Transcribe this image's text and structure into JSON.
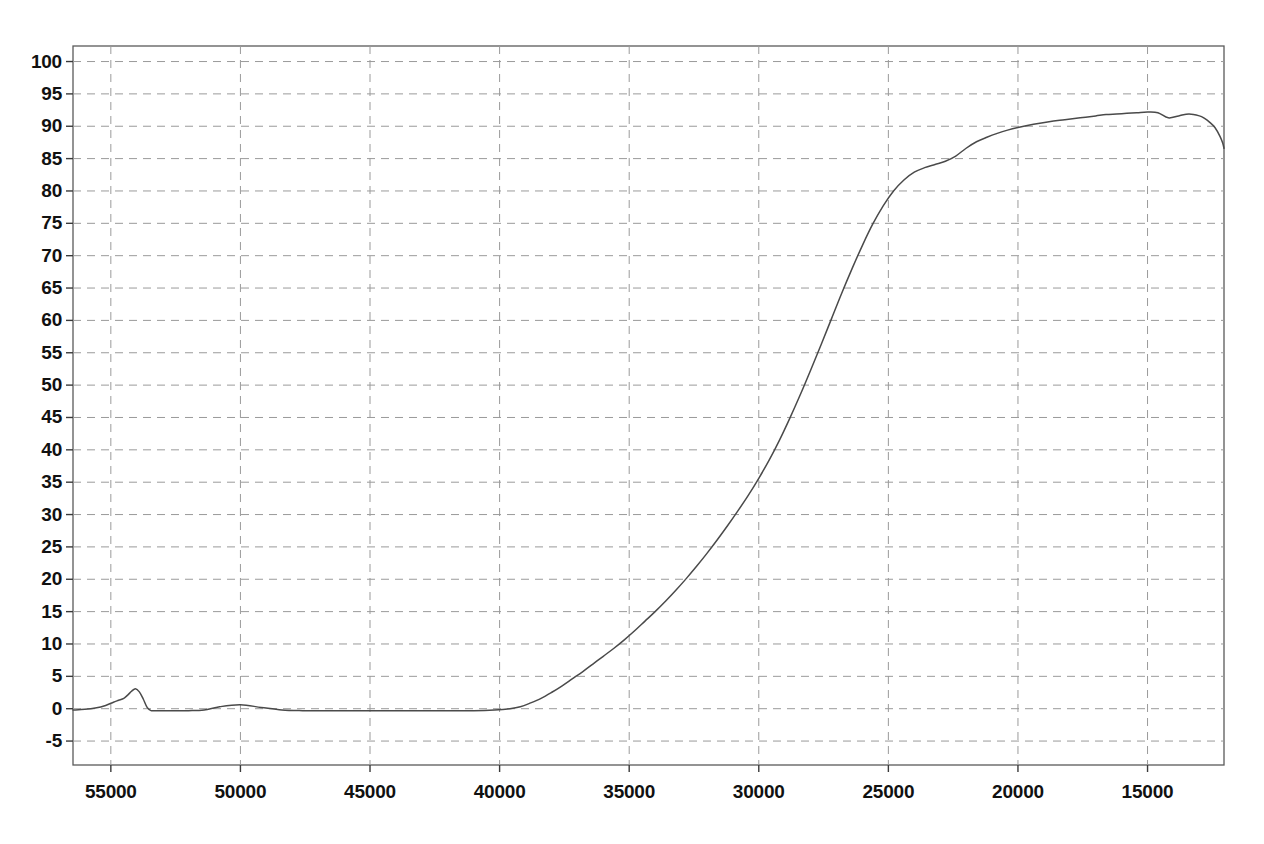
{
  "chart_data": {
    "type": "line",
    "title": "",
    "subtitle": "",
    "xlabel": "",
    "ylabel": "",
    "grid": true,
    "legend": null,
    "annotations": [],
    "x_axis": {
      "direction": "descending",
      "ticks": [
        55000,
        50000,
        45000,
        40000,
        35000,
        30000,
        25000,
        20000,
        15000
      ],
      "tick_labels": [
        "55000",
        "50000",
        "45000",
        "40000",
        "35000",
        "30000",
        "25000",
        "20000",
        "15000"
      ],
      "xlim": [
        56460,
        12050
      ]
    },
    "y_axis": {
      "ticks": [
        -5,
        0,
        5,
        10,
        15,
        20,
        25,
        30,
        35,
        40,
        45,
        50,
        55,
        60,
        65,
        70,
        75,
        80,
        85,
        90,
        95,
        100
      ],
      "tick_labels": [
        "-5",
        "0",
        "5",
        "10",
        "15",
        "20",
        "25",
        "30",
        "35",
        "40",
        "45",
        "50",
        "55",
        "60",
        "65",
        "70",
        "75",
        "80",
        "85",
        "90",
        "95",
        "100"
      ],
      "ylim": [
        -8.7,
        102.4
      ]
    },
    "series": [
      {
        "name": "transmittance",
        "color": "#4a4a4a",
        "x": [
          56460,
          56000,
          55600,
          55200,
          54900,
          54700,
          54500,
          54350,
          54200,
          54050,
          53900,
          53750,
          53600,
          53450,
          53300,
          53000,
          52600,
          52000,
          51400,
          50800,
          50000,
          49200,
          48400,
          47600,
          46800,
          46000,
          45000,
          44000,
          43000,
          42000,
          41000,
          40200,
          39600,
          39200,
          38800,
          38400,
          38000,
          37600,
          37200,
          36800,
          36400,
          36000,
          35600,
          35200,
          34800,
          34400,
          34000,
          33600,
          33200,
          32800,
          32400,
          32000,
          31600,
          31200,
          30800,
          30400,
          30000,
          29600,
          29200,
          28800,
          28400,
          28000,
          27600,
          27200,
          26800,
          26400,
          26000,
          25600,
          25200,
          24800,
          24400,
          24000,
          23600,
          23200,
          22800,
          22400,
          22000,
          21600,
          21200,
          20800,
          20400,
          20000,
          19400,
          18800,
          18200,
          17600,
          17000,
          16600,
          16200,
          15800,
          15400,
          15000,
          14600,
          14200,
          13800,
          13400,
          13000,
          12800,
          12600,
          12400,
          12200,
          12100,
          12050
        ],
        "y": [
          -0.2,
          -0.1,
          0.1,
          0.5,
          1.0,
          1.3,
          1.6,
          2.1,
          2.7,
          3.1,
          2.6,
          1.5,
          0.2,
          -0.3,
          -0.3,
          -0.3,
          -0.3,
          -0.3,
          -0.2,
          0.3,
          0.6,
          0.2,
          -0.2,
          -0.3,
          -0.3,
          -0.3,
          -0.3,
          -0.3,
          -0.3,
          -0.3,
          -0.3,
          -0.2,
          0.0,
          0.3,
          0.9,
          1.6,
          2.5,
          3.5,
          4.6,
          5.7,
          6.9,
          8.1,
          9.3,
          10.6,
          12.0,
          13.5,
          15.0,
          16.6,
          18.3,
          20.1,
          22.0,
          24.0,
          26.1,
          28.3,
          30.6,
          33.0,
          35.6,
          38.4,
          41.5,
          44.9,
          48.5,
          52.3,
          56.2,
          60.2,
          64.2,
          68.0,
          71.6,
          74.9,
          77.7,
          80.0,
          81.7,
          82.9,
          83.6,
          84.1,
          84.6,
          85.4,
          86.6,
          87.6,
          88.3,
          88.9,
          89.4,
          89.8,
          90.3,
          90.7,
          91.0,
          91.3,
          91.6,
          91.8,
          91.9,
          92.0,
          92.1,
          92.2,
          92.1,
          91.3,
          91.6,
          91.9,
          91.6,
          91.2,
          90.6,
          89.8,
          88.4,
          87.4,
          86.6
        ]
      }
    ]
  },
  "axes": {
    "y_tick_text": [
      "100",
      "95",
      "90",
      "85",
      "80",
      "75",
      "70",
      "65",
      "60",
      "55",
      "50",
      "45",
      "40",
      "35",
      "30",
      "25",
      "20",
      "15",
      "10",
      "5",
      "0",
      "-5"
    ],
    "x_tick_text": [
      "55000",
      "50000",
      "45000",
      "40000",
      "35000",
      "30000",
      "25000",
      "20000",
      "15000"
    ]
  }
}
